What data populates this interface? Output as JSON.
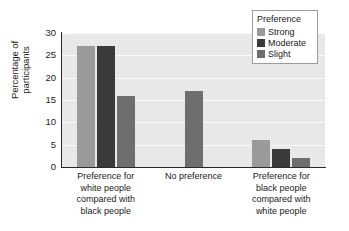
{
  "chart_data": {
    "type": "bar",
    "title": "",
    "xlabel": "",
    "ylabel": "Percentage of\nparticipants",
    "ylim": [
      0,
      30
    ],
    "yticks": [
      0,
      5,
      10,
      15,
      20,
      25,
      30
    ],
    "ytick_labels": [
      "0",
      "5",
      "10",
      "15",
      "20",
      "25",
      "30"
    ],
    "grid": true,
    "legend_position": "top-right",
    "legend_title": "Preference",
    "categories": [
      "Preference for\nwhite people\ncompared with\nblack people",
      "No preference",
      "Preference for\nblack people\ncompared with\nwhite people"
    ],
    "series": [
      {
        "name": "Strong",
        "color": "#9a9a9a",
        "values": [
          27,
          null,
          6
        ]
      },
      {
        "name": "Moderate",
        "color": "#3a3a3a",
        "values": [
          27,
          null,
          4
        ]
      },
      {
        "name": "Slight",
        "color": "#6e6e6e",
        "values": [
          16,
          17,
          2
        ]
      }
    ]
  },
  "axes": {
    "y_title": "Percentage of\nparticipants"
  },
  "legend": {
    "title": "Preference",
    "entries": [
      {
        "label": "Strong",
        "color": "#9a9a9a"
      },
      {
        "label": "Moderate",
        "color": "#3a3a3a"
      },
      {
        "label": "Slight",
        "color": "#6e6e6e"
      }
    ]
  },
  "colors": {
    "plot_background": "#e8e8e8",
    "gridline": "#fafafa",
    "axis": "#2a2a2a",
    "page_background": "#ffffff",
    "text": "#1a1a1a"
  }
}
